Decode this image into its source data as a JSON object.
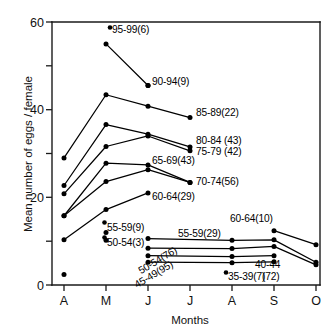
{
  "chart_data": {
    "type": "line",
    "title": "",
    "xlabel": "Months",
    "ylabel": "Mean number of eggs / female",
    "x_categories": [
      "A",
      "M",
      "J",
      "J",
      "A",
      "S",
      "O"
    ],
    "x_tick_labels": [
      "A",
      "M",
      "J",
      "J",
      "A",
      "S",
      "O"
    ],
    "y_tick_labels": [
      "0",
      "20",
      "40",
      "60"
    ],
    "y_major_ticks": [
      0,
      20,
      40,
      60
    ],
    "y_minor_ticks": [
      10,
      30,
      50
    ],
    "ylim": [
      0,
      60
    ],
    "grid": false,
    "legend": "inline-labels",
    "series": [
      {
        "name": "95-99(6)",
        "label": "95-99(6)",
        "points": [
          {
            "x": "M",
            "y": 55.0
          },
          {
            "x": "J",
            "y": 45.5
          }
        ],
        "has_line": true
      },
      {
        "name": "90-94(9)",
        "label": "90-94(9)",
        "points": [
          {
            "x": "J",
            "y": 45.5
          }
        ],
        "has_line": false
      },
      {
        "name": "85-89(22)",
        "label": "85-89(22)",
        "points": [
          {
            "x": "A",
            "y": 29.0
          },
          {
            "x": "M",
            "y": 43.4
          },
          {
            "x": "J",
            "y": 40.8
          },
          {
            "x": "J",
            "y": 38.2
          }
        ],
        "has_line": true
      },
      {
        "name": "80-84(43)",
        "label": "80-84(43)",
        "points": [
          {
            "x": "A",
            "y": 22.7
          },
          {
            "x": "M",
            "y": 36.6
          },
          {
            "x": "J",
            "y": 34.4
          },
          {
            "x": "J",
            "y": 31.5
          }
        ],
        "has_line": true
      },
      {
        "name": "75-79(42)",
        "label": "75-79 (42)",
        "points": [
          {
            "x": "A",
            "y": 20.8
          },
          {
            "x": "M",
            "y": 31.6
          },
          {
            "x": "J",
            "y": 34.0
          },
          {
            "x": "J",
            "y": 30.6
          }
        ],
        "has_line": true
      },
      {
        "name": "65-69(43)",
        "label": "65-69(43)",
        "points": [
          {
            "x": "A",
            "y": 15.8
          },
          {
            "x": "M",
            "y": 27.8
          },
          {
            "x": "J",
            "y": 27.4
          },
          {
            "x": "J",
            "y": 23.4
          }
        ],
        "has_line": true
      },
      {
        "name": "70-74(56)",
        "label": "70-74(56)",
        "points": [
          {
            "x": "A",
            "y": 15.8
          },
          {
            "x": "M",
            "y": 23.6
          },
          {
            "x": "J",
            "y": 26.3
          },
          {
            "x": "J",
            "y": 23.4
          }
        ],
        "has_line": true
      },
      {
        "name": "60-64(29)",
        "label": "60-64(29)",
        "points": [
          {
            "x": "A",
            "y": 10.3
          },
          {
            "x": "M",
            "y": 17.2
          },
          {
            "x": "J",
            "y": 21.0
          }
        ],
        "has_line": true
      },
      {
        "name": "55-59(9)",
        "label": "55-59(9)",
        "points": [
          {
            "x": "M",
            "y": 12.0
          }
        ],
        "has_line": false
      },
      {
        "name": "50-54(3)",
        "label": "50-54(3)",
        "points": [
          {
            "x": "M",
            "y": 10.2
          }
        ],
        "has_line": false
      },
      {
        "name": "55-59(29)",
        "label": "55-59(29)",
        "points": [
          {
            "x": "J",
            "y": 10.6
          },
          {
            "x": "A",
            "y": 10.2
          },
          {
            "x": "S",
            "y": 10.3
          },
          {
            "x": "O",
            "y": 5.2
          }
        ],
        "has_line": true
      },
      {
        "name": "60-64(10)",
        "label": "60-64(10)",
        "points": [
          {
            "x": "S",
            "y": 12.4
          },
          {
            "x": "O",
            "y": 9.2
          }
        ],
        "has_line": true
      },
      {
        "name": "50-54(76)",
        "label": "50-54(76)",
        "points": [
          {
            "x": "J",
            "y": 8.4
          },
          {
            "x": "A",
            "y": 8.3
          },
          {
            "x": "S",
            "y": 8.8
          },
          {
            "x": "O",
            "y": 4.6
          }
        ],
        "has_line": true
      },
      {
        "name": "45-49(95)",
        "label": "45-49(95)",
        "points": [
          {
            "x": "J",
            "y": 6.7
          },
          {
            "x": "A",
            "y": 6.5
          },
          {
            "x": "S",
            "y": 6.7
          }
        ],
        "has_line": true
      },
      {
        "name": "40-44(72)",
        "label": "40-44 (72)",
        "points": [
          {
            "x": "J",
            "y": 5.2
          },
          {
            "x": "A",
            "y": 5.1
          },
          {
            "x": "S",
            "y": 5.3
          }
        ],
        "has_line": true
      },
      {
        "name": "35-39(7)",
        "label": "35-39(7)",
        "points": [
          {
            "x": "A",
            "y": 2.4
          }
        ],
        "has_line": false
      }
    ],
    "annotations": [
      {
        "id": "ann-95-99",
        "text": "95-99(6)"
      },
      {
        "id": "ann-90-94",
        "text": "90-94(9)"
      },
      {
        "id": "ann-85-89",
        "text": "85-89(22)"
      },
      {
        "id": "ann-80-84",
        "text": "80-84 (43)"
      },
      {
        "id": "ann-75-79",
        "text": "75-79 (42)"
      },
      {
        "id": "ann-65-69",
        "text": "65-69(43)"
      },
      {
        "id": "ann-70-74",
        "text": "70-74(56)"
      },
      {
        "id": "ann-60-64-spring",
        "text": "60-64(29)"
      },
      {
        "id": "ann-55-59-spring",
        "text": "55-59(9)"
      },
      {
        "id": "ann-50-54-spring",
        "text": "50-54(3)"
      },
      {
        "id": "ann-55-59-autumn",
        "text": "55-59(29)"
      },
      {
        "id": "ann-60-64-autumn",
        "text": "60-64(10)"
      },
      {
        "id": "ann-50-54-autumn",
        "text": "50-54(76)"
      },
      {
        "id": "ann-45-49-autumn",
        "text": "45-49(95)"
      },
      {
        "id": "ann-40-44-line1",
        "text": "40-44"
      },
      {
        "id": "ann-40-44-line2",
        "text": "(72)"
      },
      {
        "id": "ann-35-39",
        "text": "35-39(7)"
      }
    ]
  },
  "axes": {
    "y_title": "Mean number of eggs / female",
    "x_title": "Months",
    "y_ticks": [
      "60",
      "40",
      "20",
      "0"
    ],
    "x_ticks": [
      "A",
      "M",
      "J",
      "J",
      "A",
      "S",
      "O"
    ]
  }
}
